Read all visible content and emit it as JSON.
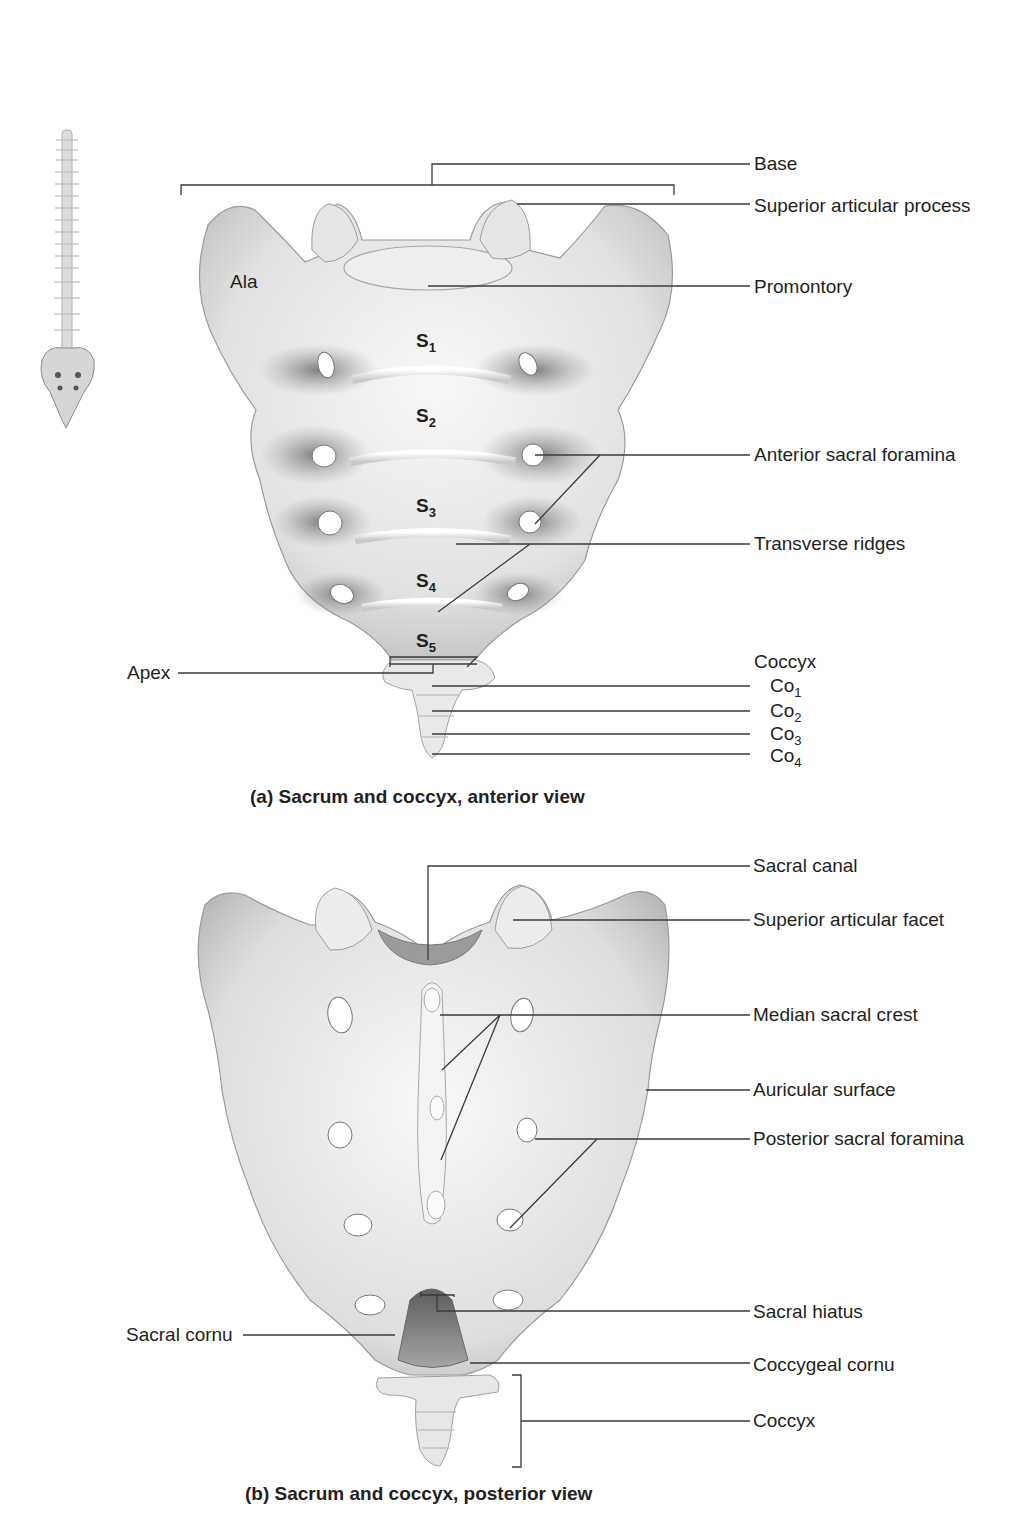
{
  "figure_a": {
    "caption": "(a) Sacrum and coccyx, anterior view",
    "inner_labels": {
      "ala": "Ala",
      "segments": [
        {
          "base": "S",
          "sub": "1"
        },
        {
          "base": "S",
          "sub": "2"
        },
        {
          "base": "S",
          "sub": "3"
        },
        {
          "base": "S",
          "sub": "4"
        },
        {
          "base": "S",
          "sub": "5"
        }
      ]
    },
    "labels_right": {
      "base": "Base",
      "superior_articular_process": "Superior articular process",
      "promontory": "Promontory",
      "anterior_sacral_foramina": "Anterior sacral foramina",
      "transverse_ridges": "Transverse ridges",
      "coccyx_heading": "Coccyx",
      "coccygeal_segments": [
        {
          "base": "Co",
          "sub": "1"
        },
        {
          "base": "Co",
          "sub": "2"
        },
        {
          "base": "Co",
          "sub": "3"
        },
        {
          "base": "Co",
          "sub": "4"
        }
      ]
    },
    "labels_left": {
      "apex": "Apex"
    }
  },
  "figure_b": {
    "caption": "(b) Sacrum and coccyx, posterior view",
    "labels_right": {
      "sacral_canal": "Sacral canal",
      "superior_articular_facet": "Superior articular facet",
      "median_sacral_crest": "Median sacral crest",
      "auricular_surface": "Auricular surface",
      "posterior_sacral_foramina": "Posterior sacral foramina",
      "sacral_hiatus": "Sacral hiatus",
      "coccygeal_cornu": "Coccygeal cornu",
      "coccyx": "Coccyx"
    },
    "labels_left": {
      "sacral_cornu": "Sacral cornu"
    }
  },
  "thumbnail": {
    "subject": "vertebral column with sacrum highlighted"
  },
  "colors": {
    "bone_light": "#f2f2f2",
    "bone_mid": "#cfcfcf",
    "bone_shadow": "#8e8e8e",
    "leader_line": "#3a3a3a",
    "text": "#231f20"
  }
}
